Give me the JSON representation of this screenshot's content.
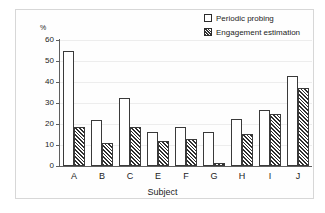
{
  "chart_data": {
    "type": "bar",
    "title": "",
    "xlabel": "Subject",
    "ylabel": "%",
    "categories": [
      "A",
      "B",
      "C",
      "E",
      "F",
      "G",
      "H",
      "I",
      "J"
    ],
    "series": [
      {
        "name": "Periodic probing",
        "pattern": "dotted",
        "values": [
          55,
          22,
          32.5,
          16,
          18.5,
          16,
          22.3,
          26.7,
          43
        ]
      },
      {
        "name": "Engagement estimation",
        "pattern": "diagonal-hatch",
        "values": [
          18.5,
          11,
          18.5,
          12,
          13,
          1.5,
          15.2,
          25,
          37
        ]
      }
    ],
    "ylim": [
      0,
      60
    ],
    "yticks": [
      0,
      10,
      20,
      30,
      40,
      50,
      60
    ],
    "ytick_labels": [
      "0",
      "10",
      "20",
      "30",
      "40",
      "50",
      "60"
    ],
    "grid": true,
    "legend_position": "top-right",
    "colors": {
      "axis": "#5f5f5f",
      "grid": "#ededed",
      "bar_outline": "#3a3a3a",
      "text": "#1c1c1c",
      "frame": "#d7d7d7",
      "background": "#ffffff"
    }
  },
  "legend": {
    "items": [
      {
        "label": "Periodic probing",
        "key": "dotted-square-icon"
      },
      {
        "label": "Engagement estimation",
        "key": "hatched-square-icon"
      }
    ]
  }
}
